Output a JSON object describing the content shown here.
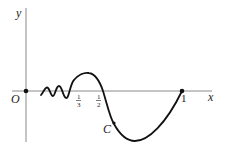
{
  "diagram": {
    "title": "",
    "axes": {
      "x_label": "x",
      "y_label": "y",
      "origin_label": "O"
    },
    "tick_labels": {
      "third_num": "1",
      "third_den": "3",
      "half_num": "1",
      "half_den": "2",
      "one": "1"
    },
    "curve_label": "C",
    "colors": {
      "axis": "#8a8a8a",
      "curve": "#111111",
      "text": "#222222"
    }
  }
}
